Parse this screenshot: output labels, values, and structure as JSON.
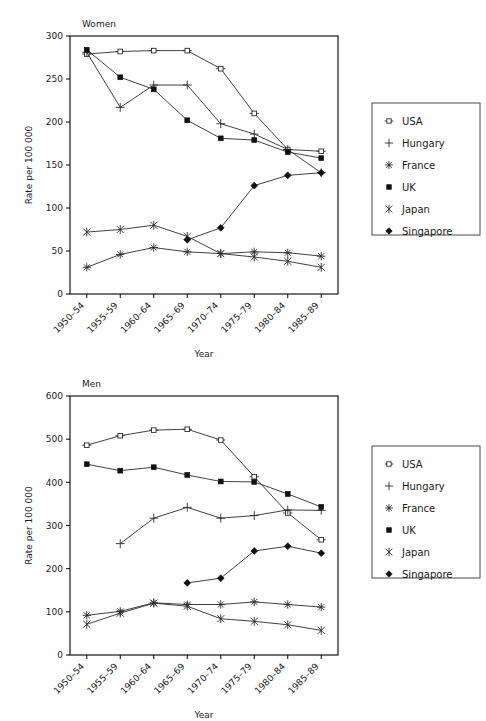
{
  "figure": {
    "ylabel": "Rate per 100 000",
    "xlabel": "Year",
    "categories": [
      "1950–54",
      "1955–59",
      "1960–64",
      "1965–69",
      "1970–74",
      "1975–79",
      "1980–84",
      "1985–89"
    ],
    "legend_entries": [
      {
        "label": "USA",
        "marker": "open-square"
      },
      {
        "label": "Hungary",
        "marker": "plus"
      },
      {
        "label": "France",
        "marker": "asterisk"
      },
      {
        "label": "UK",
        "marker": "filled-square"
      },
      {
        "label": "Japan",
        "marker": "x-star"
      },
      {
        "label": "Singapore",
        "marker": "filled-diamond"
      }
    ]
  },
  "panels": {
    "women": {
      "title": "Women",
      "yticks": [
        "0",
        "50",
        "100",
        "150",
        "200",
        "250",
        "300"
      ]
    },
    "men": {
      "title": "Men",
      "yticks": [
        "0",
        "100",
        "200",
        "300",
        "400",
        "500",
        "600"
      ]
    }
  },
  "chart_data": [
    {
      "type": "line",
      "title": "Women",
      "xlabel": "Year",
      "ylabel": "Rate per 100 000",
      "categories": [
        "1950–54",
        "1955–59",
        "1960–64",
        "1965–69",
        "1970–74",
        "1975–79",
        "1980–84",
        "1985–89"
      ],
      "ylim": [
        0,
        300
      ],
      "yticks": [
        0,
        50,
        100,
        150,
        200,
        250,
        300
      ],
      "grid": false,
      "legend_position": "right-outside",
      "series": [
        {
          "name": "USA",
          "marker": "open-square",
          "values": [
            279,
            282,
            283,
            283,
            262,
            210,
            168,
            166
          ]
        },
        {
          "name": "Hungary",
          "marker": "plus",
          "values": [
            281,
            217,
            243,
            243,
            198,
            186,
            168,
            141
          ]
        },
        {
          "name": "France",
          "marker": "asterisk",
          "values": [
            31,
            46,
            54,
            49,
            47,
            49,
            48,
            44
          ]
        },
        {
          "name": "UK",
          "marker": "filled-square",
          "values": [
            284,
            252,
            238,
            202,
            181,
            179,
            165,
            158
          ]
        },
        {
          "name": "Japan",
          "marker": "x-star",
          "values": [
            72,
            75,
            80,
            67,
            47,
            43,
            38,
            31
          ]
        },
        {
          "name": "Singapore",
          "marker": "filled-diamond",
          "values": [
            null,
            null,
            null,
            63,
            77,
            126,
            138,
            141
          ]
        }
      ]
    },
    {
      "type": "line",
      "title": "Men",
      "xlabel": "Year",
      "ylabel": "Rate per 100 000",
      "categories": [
        "1950–54",
        "1955–59",
        "1960–64",
        "1965–69",
        "1970–74",
        "1975–79",
        "1980–84",
        "1985–89"
      ],
      "ylim": [
        0,
        600
      ],
      "yticks": [
        0,
        100,
        200,
        300,
        400,
        500,
        600
      ],
      "grid": false,
      "legend_position": "right-outside",
      "series": [
        {
          "name": "USA",
          "marker": "open-square",
          "values": [
            486,
            508,
            521,
            523,
            498,
            413,
            329,
            267
          ]
        },
        {
          "name": "Hungary",
          "marker": "plus",
          "values": [
            null,
            258,
            317,
            342,
            317,
            323,
            336,
            335
          ]
        },
        {
          "name": "France",
          "marker": "asterisk",
          "values": [
            92,
            101,
            121,
            117,
            117,
            123,
            117,
            111
          ]
        },
        {
          "name": "UK",
          "marker": "filled-square",
          "values": [
            442,
            427,
            435,
            417,
            402,
            401,
            373,
            343
          ]
        },
        {
          "name": "Japan",
          "marker": "x-star",
          "values": [
            71,
            97,
            120,
            113,
            84,
            78,
            70,
            57
          ]
        },
        {
          "name": "Singapore",
          "marker": "filled-diamond",
          "values": [
            null,
            null,
            null,
            167,
            178,
            241,
            252,
            236
          ]
        }
      ]
    }
  ]
}
